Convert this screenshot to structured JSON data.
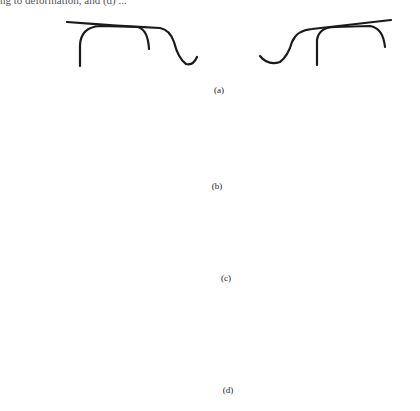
{
  "caption_fragment": "ng to deformation, and (d) ...",
  "panels": [
    {
      "id": "a",
      "label": "(a)"
    },
    {
      "id": "b",
      "label": "(b)"
    },
    {
      "id": "c",
      "label": "(c)"
    },
    {
      "id": "d",
      "label": "(d)"
    }
  ],
  "stroke_color": "#1a1a1a"
}
